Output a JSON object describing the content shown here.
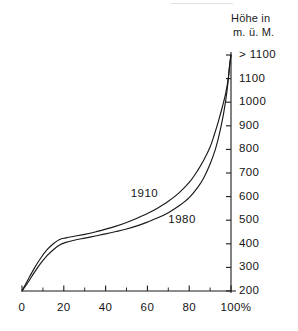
{
  "figure": {
    "axis_title_line1": "Höhe in",
    "axis_title_line2": "m. ü. M.",
    "x_unit_suffix": "%"
  },
  "chart_data": {
    "type": "line",
    "title": "Höhe in m. ü. M.",
    "xlabel": "",
    "ylabel": "Höhe in m. ü. M.",
    "xlim": [
      0,
      100
    ],
    "ylim": [
      200,
      1200
    ],
    "grid": false,
    "legend_position": "inline-annotations",
    "x_ticks": [
      0,
      10,
      20,
      30,
      40,
      50,
      60,
      70,
      80,
      90,
      100
    ],
    "x_tick_labels": [
      "0",
      "",
      "20",
      "",
      "40",
      "",
      "60",
      "",
      "80",
      "",
      "100%"
    ],
    "x_tick_labels_major": [
      "0",
      "20",
      "40",
      "60",
      "80",
      "100%"
    ],
    "y_ticks": [
      200,
      300,
      400,
      500,
      600,
      700,
      800,
      900,
      1000,
      1100,
      1200
    ],
    "y_tick_labels": [
      "200",
      "300",
      "400",
      "500",
      "600",
      "700",
      "800",
      "900",
      "1000",
      "1100",
      "> 1100"
    ],
    "y_axis_side": "right",
    "annotations": [
      {
        "text": "1910",
        "x": 52,
        "y": 610
      },
      {
        "text": "1980",
        "x": 70,
        "y": 500
      }
    ],
    "series": [
      {
        "name": "1910",
        "label": "1910",
        "color": "#1a1a1a",
        "x": [
          0,
          3,
          6,
          9,
          12,
          15,
          18,
          21,
          25,
          30,
          35,
          40,
          45,
          50,
          55,
          60,
          65,
          70,
          75,
          80,
          84,
          87,
          90,
          92,
          94,
          96,
          97.5,
          98.7,
          99.5,
          100
        ],
        "y": [
          200,
          250,
          298,
          340,
          375,
          400,
          418,
          425,
          432,
          440,
          450,
          462,
          475,
          490,
          508,
          528,
          552,
          580,
          615,
          660,
          710,
          755,
          810,
          862,
          920,
          985,
          1040,
          1100,
          1165,
          1200
        ]
      },
      {
        "name": "1980",
        "label": "1980",
        "color": "#1a1a1a",
        "x": [
          0,
          3,
          6,
          9,
          12,
          15,
          18,
          21,
          25,
          30,
          35,
          40,
          45,
          50,
          55,
          60,
          65,
          70,
          75,
          80,
          84,
          87,
          90,
          92.5,
          94.5,
          96.2,
          97.5,
          98.5,
          99.3,
          100
        ],
        "y": [
          200,
          238,
          280,
          318,
          350,
          375,
          395,
          406,
          415,
          424,
          433,
          442,
          452,
          463,
          476,
          492,
          510,
          532,
          560,
          596,
          638,
          680,
          738,
          800,
          868,
          940,
          1010,
          1080,
          1155,
          1200
        ]
      }
    ]
  }
}
